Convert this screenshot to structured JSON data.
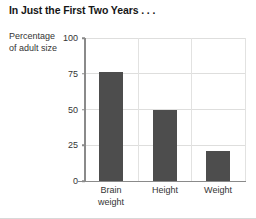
{
  "title": "In Just the First Two Years . . .",
  "y_caption": {
    "line1": "Percentage",
    "line2": "of adult size"
  },
  "chart_data": {
    "type": "bar",
    "title": "In Just the First Two Years . . .",
    "xlabel": "",
    "ylabel": "Percentage of adult size",
    "categories": [
      "Brain weight",
      "Height",
      "Weight"
    ],
    "category_lines": [
      [
        "Brain",
        "weight"
      ],
      [
        "Height",
        ""
      ],
      [
        "Weight",
        ""
      ]
    ],
    "values": [
      76,
      50,
      21
    ],
    "ylim": [
      0,
      100
    ],
    "yticks": [
      0,
      25,
      50,
      75,
      100
    ],
    "ytick_labels": [
      "0",
      "25",
      "50",
      "75",
      "100"
    ],
    "grid": "horizontal-and-vertical",
    "legend": "none",
    "bar_color": "#4d4d4d",
    "gridline_color": "#dededd",
    "axis_color": "#8a8a8a",
    "text_color": "#343434",
    "background": "#ffffff"
  }
}
